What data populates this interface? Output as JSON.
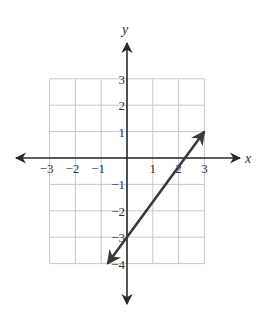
{
  "chart_data": {
    "type": "line",
    "title": "",
    "xlabel": "x",
    "ylabel": "y",
    "xlim": [
      -3,
      3
    ],
    "ylim": [
      -4,
      3
    ],
    "grid": true,
    "x_ticks": [
      -3,
      -2,
      -1,
      1,
      2,
      3
    ],
    "y_ticks": [
      3,
      2,
      1,
      -1,
      -2,
      -3,
      -4
    ],
    "x_tick_labels": [
      "−3",
      "−2",
      "−1",
      "1",
      "2",
      "3"
    ],
    "y_tick_labels": [
      "3",
      "2",
      "1",
      "−1",
      "−2",
      "−3",
      "−4"
    ],
    "series": [
      {
        "name": "line",
        "equation": "y = (4/3)x - 3",
        "slope": 1.3333,
        "y_intercept": -3,
        "x_intercept": 2.25,
        "points": [
          [
            -0.75,
            -4
          ],
          [
            0,
            -3
          ],
          [
            3,
            1
          ]
        ],
        "arrows_both_ends": true,
        "color": "#3a3a3a"
      }
    ],
    "colors": {
      "grid": "#c8c8c8",
      "axis": "#2a2a2a",
      "line": "#3a3a3a",
      "text": "#333333"
    }
  }
}
